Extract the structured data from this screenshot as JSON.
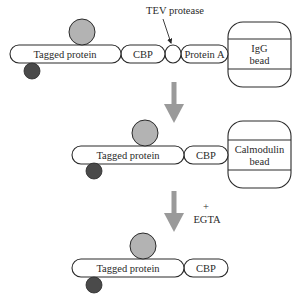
{
  "diagram": {
    "type": "TAP purification workflow",
    "colors": {
      "outline": "#2a2a2a",
      "grey_circle": "#b3b3b3",
      "dark_circle": "#4a4a4a",
      "arrow": "#9a9a9a",
      "background": "#ffffff"
    },
    "step1": {
      "tagged_protein": "Tagged protein",
      "cbp": "CBP",
      "protein_a": "Protein A",
      "bead_line1": "IgG",
      "bead_line2": "bead",
      "tev_label": "TEV protease"
    },
    "step2": {
      "tagged_protein": "Tagged protein",
      "cbp": "CBP",
      "bead_line1": "Calmodulin",
      "bead_line2": "bead"
    },
    "step3": {
      "tagged_protein": "Tagged protein",
      "cbp": "CBP",
      "reagent_plus": "+",
      "reagent": "EGTA"
    }
  }
}
